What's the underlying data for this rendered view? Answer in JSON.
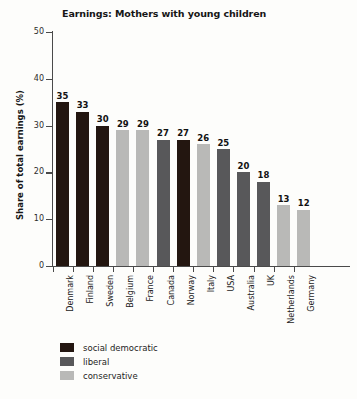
{
  "chart_data": {
    "type": "bar",
    "title": "Earnings: Mothers with young children",
    "xlabel": "",
    "ylabel": "Share of total earnings (%)",
    "ylim": [
      0,
      50
    ],
    "yticks": [
      0,
      10,
      20,
      30,
      40,
      50
    ],
    "grid": false,
    "legend_position": "bottom-left",
    "categories": [
      "Denmark",
      "Finland",
      "Sweden",
      "Belgium",
      "France",
      "Canada",
      "Norway",
      "Italy",
      "USA",
      "Australia",
      "UK",
      "Netherlands",
      "Germany"
    ],
    "values": [
      35,
      33,
      30,
      29,
      29,
      27,
      27,
      26,
      25,
      20,
      18,
      13,
      12
    ],
    "point_groups": [
      "social democratic",
      "social democratic",
      "social democratic",
      "conservative",
      "conservative",
      "liberal",
      "social democratic",
      "conservative",
      "liberal",
      "liberal",
      "liberal",
      "conservative",
      "conservative"
    ],
    "series": [
      {
        "name": "Share of total earnings (%)",
        "values": [
          35,
          33,
          30,
          29,
          29,
          27,
          27,
          26,
          25,
          20,
          18,
          13,
          12
        ]
      }
    ],
    "legend": [
      {
        "label": "social democratic",
        "color": "#231610"
      },
      {
        "label": "liberal",
        "color": "#58585a"
      },
      {
        "label": "conservative",
        "color": "#b9b9b7"
      }
    ]
  }
}
